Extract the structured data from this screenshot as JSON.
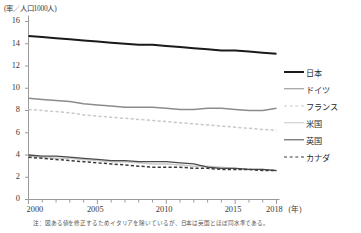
{
  "chart_data": {
    "type": "line",
    "title": "",
    "ylabel": "(率／人口1000人)",
    "xlabel": "(年)",
    "ylim": [
      0,
      16
    ],
    "xlim": [
      2000,
      2018
    ],
    "yticks": [
      16,
      14,
      12,
      10,
      8,
      6,
      4,
      2,
      0
    ],
    "xticks": [
      2000,
      2005,
      2010,
      2015,
      2018
    ],
    "xtick_labels": [
      "2000",
      "2005",
      "2010",
      "2015",
      "2018"
    ],
    "grid": false,
    "legend_position": "right",
    "x": [
      2000,
      2001,
      2002,
      2003,
      2004,
      2005,
      2006,
      2007,
      2008,
      2009,
      2010,
      2011,
      2012,
      2013,
      2014,
      2015,
      2016,
      2017,
      2018
    ],
    "series": [
      {
        "name": "日本",
        "color": "#1a1a1a",
        "style": "solid",
        "width": 2.0,
        "values": [
          14.7,
          14.6,
          14.5,
          14.4,
          14.3,
          14.2,
          14.1,
          14.0,
          13.9,
          13.9,
          13.8,
          13.7,
          13.6,
          13.5,
          13.4,
          13.4,
          13.3,
          13.2,
          13.1
        ]
      },
      {
        "name": "ドイツ",
        "color": "#8c8c8c",
        "style": "solid",
        "width": 1.5,
        "values": [
          9.1,
          9.0,
          8.9,
          8.8,
          8.6,
          8.5,
          8.4,
          8.3,
          8.3,
          8.3,
          8.2,
          8.1,
          8.1,
          8.2,
          8.2,
          8.1,
          8.0,
          8.0,
          8.2
        ]
      },
      {
        "name": "フランス",
        "color": "#c9c9c9",
        "style": "dashed",
        "width": 1.5,
        "values": [
          8.1,
          8.0,
          7.9,
          7.8,
          7.6,
          7.5,
          7.4,
          7.3,
          7.2,
          7.1,
          7.0,
          6.9,
          6.8,
          6.7,
          6.6,
          6.5,
          6.4,
          6.3,
          6.2
        ]
      },
      {
        "name": "米国",
        "color": "#c9c9c9",
        "style": "solid",
        "width": 1.5,
        "values": [
          3.9,
          3.8,
          3.7,
          3.7,
          3.6,
          3.5,
          3.4,
          3.4,
          3.3,
          3.2,
          3.2,
          3.1,
          3.0,
          3.0,
          2.9,
          2.8,
          2.7,
          2.7,
          2.6
        ]
      },
      {
        "name": "英国",
        "color": "#4a4a4a",
        "style": "solid",
        "width": 1.3,
        "values": [
          4.0,
          3.9,
          3.9,
          3.8,
          3.7,
          3.6,
          3.5,
          3.5,
          3.4,
          3.4,
          3.4,
          3.3,
          3.2,
          2.9,
          2.8,
          2.8,
          2.7,
          2.7,
          2.6
        ]
      },
      {
        "name": "カナダ",
        "color": "#3a3a3a",
        "style": "dashed",
        "width": 1.5,
        "values": [
          3.8,
          3.7,
          3.6,
          3.5,
          3.4,
          3.3,
          3.2,
          3.1,
          3.0,
          2.9,
          2.9,
          2.9,
          2.8,
          2.8,
          2.7,
          2.7,
          2.7,
          2.6,
          2.6
        ]
      }
    ],
    "note": "注：図ある値を修正するためイタリアを除いているが、日本は英国とほぼ同水準である。"
  },
  "axis": {
    "y_title": "(率／人口1000人)",
    "x_unit": "(年)",
    "yticks": [
      "16",
      "14",
      "12",
      "10",
      "8",
      "6",
      "4",
      "2",
      "0"
    ],
    "xticks": [
      "2000",
      "2005",
      "2010",
      "2015",
      "2018"
    ]
  },
  "legend": {
    "items": [
      {
        "label": "日本"
      },
      {
        "label": "ドイツ"
      },
      {
        "label": "フランス"
      },
      {
        "label": "米国"
      },
      {
        "label": "英国"
      },
      {
        "label": "カナダ"
      }
    ]
  },
  "footnote": {
    "text": "注：図ある値を修正するためイタリアを除いているが、日本は英国とほぼ同水準である。"
  }
}
